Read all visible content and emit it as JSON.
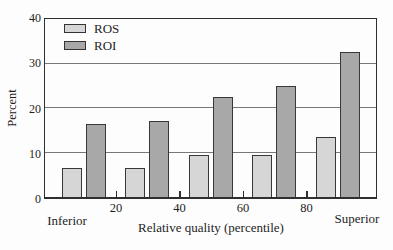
{
  "chart_data": {
    "type": "bar",
    "title": "",
    "xlabel": "Relative quality (percentile)",
    "ylabel": "Percent",
    "x_axis_left_label": "Inferior",
    "x_axis_right_label": "Superior",
    "ylim": [
      0,
      40
    ],
    "y_ticks": [
      0,
      10,
      20,
      30,
      40
    ],
    "x_ticks": [
      20,
      40,
      60,
      80
    ],
    "x_range": [
      0,
      100
    ],
    "group_centers": [
      10,
      30,
      50,
      70,
      90
    ],
    "grid": "horizontal gridlines at 10, 20, 30",
    "legend_position": "top-left inside plot",
    "series": [
      {
        "name": "ROS",
        "color": "#d6d6d6",
        "values": [
          6.5,
          6.5,
          9.5,
          9.5,
          13.5
        ]
      },
      {
        "name": "ROI",
        "color": "#a8a8a8",
        "values": [
          16.5,
          17,
          22.5,
          25,
          32.5
        ]
      }
    ],
    "bar_border_color": "#383838",
    "axis_color": "#2f2f2f",
    "gridline_color": "#787878",
    "text_color": "#1e1e1e",
    "background_color": "#fdfdfd"
  }
}
